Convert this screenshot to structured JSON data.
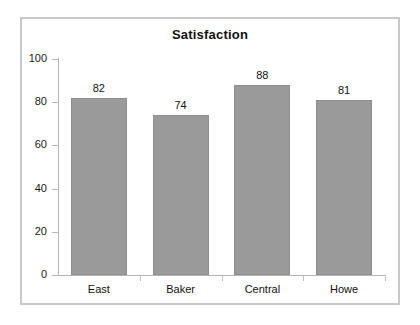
{
  "chart_data": {
    "type": "bar",
    "title": "Satisfaction",
    "xlabel": "",
    "ylabel": "",
    "categories": [
      "East",
      "Baker",
      "Central",
      "Howe"
    ],
    "values": [
      82,
      74,
      88,
      81
    ],
    "value_labels": [
      "82",
      "74",
      "88",
      "81"
    ],
    "ylim": [
      0,
      100
    ],
    "ytick_labels": [
      "0",
      "20",
      "40",
      "60",
      "80",
      "100"
    ],
    "ytick_values": [
      0,
      20,
      40,
      60,
      80,
      100
    ],
    "grid": false,
    "legend": false,
    "bar_color": "#9a9a9a",
    "frame_color": "#c8c8c8",
    "axis_color": "#b5b5b5",
    "text_color": "#111111",
    "background": "#ffffff"
  }
}
